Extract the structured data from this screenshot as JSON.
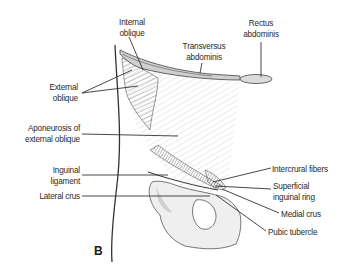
{
  "figure": {
    "panel_letter": "B",
    "labels": {
      "internal_oblique": [
        "Internal",
        "oblique"
      ],
      "rectus_abdominis": [
        "Rectus",
        "abdominis"
      ],
      "transversus_abdominis": [
        "Transversus",
        "abdominis"
      ],
      "external_oblique": [
        "External",
        "oblique"
      ],
      "aponeurosis": [
        "Aponeurosis of",
        "external oblique"
      ],
      "inguinal_ligament": [
        "Inguinal",
        "ligament"
      ],
      "lateral_crus": "Lateral crus",
      "intercrural_fibers": "Intercrural fibers",
      "superficial_inguinal_ring": [
        "Superficial",
        "inguinal ring"
      ],
      "medial_crus": "Medial crus",
      "pubic_tubercle": "Pubic tubercle"
    },
    "colors": {
      "line": "#333333",
      "muscle_shade": "#6e6e6e",
      "bone_fill": "#eeeeee",
      "text": "#2a2a2a"
    }
  }
}
